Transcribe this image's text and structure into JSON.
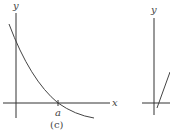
{
  "figure_c": {
    "y_axis_label": "y",
    "x_axis_label": "x",
    "tick_label": "a",
    "caption": "(c)"
  },
  "figure_d_partial": {
    "y_axis_label": "y"
  },
  "colors": {
    "axis": "#333333",
    "curve": "#444444",
    "text": "#444444"
  }
}
